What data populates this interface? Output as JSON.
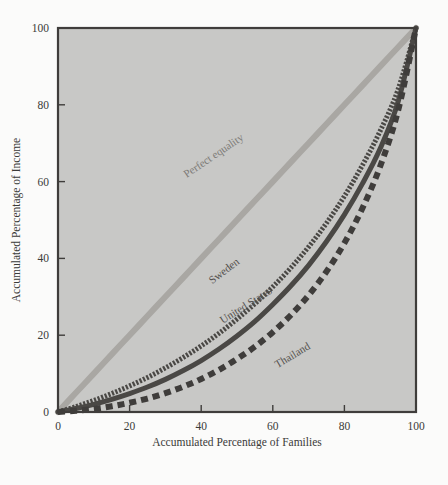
{
  "figure": {
    "background_color": "#fbfbfa",
    "plot_background_color": "#c8c8c6",
    "frame_color": "#3f3d3b"
  },
  "chart_data": {
    "type": "line",
    "title": "",
    "subtitle": "",
    "xlabel": "Accumulated Percentage of Families",
    "ylabel": "Accumulated Percentage of Income",
    "xlim": [
      0,
      100
    ],
    "ylim": [
      0,
      100
    ],
    "xticks": [
      0,
      20,
      40,
      60,
      80,
      100
    ],
    "yticks": [
      0,
      20,
      40,
      60,
      80,
      100
    ],
    "xtick_labels": [
      "0",
      "20",
      "40",
      "60",
      "80",
      "100"
    ],
    "ytick_labels": [
      "0",
      "20",
      "40",
      "60",
      "80",
      "100"
    ],
    "grid": false,
    "legend_position": "inline-annotations",
    "annotations": [
      {
        "text": "Perfect equality",
        "x": 44,
        "y": 66
      },
      {
        "text": "Sweden",
        "x": 47,
        "y": 36
      },
      {
        "text": "United States",
        "x": 53,
        "y": 27
      },
      {
        "text": "Thailand",
        "x": 66,
        "y": 14
      }
    ],
    "x": [
      0,
      5,
      10,
      15,
      20,
      25,
      30,
      35,
      40,
      45,
      50,
      55,
      60,
      65,
      70,
      75,
      80,
      85,
      90,
      95,
      100
    ],
    "series": [
      {
        "name": "Perfect equality",
        "color": "#a9a7a3",
        "style": "solid",
        "width": 6,
        "values": [
          0,
          5,
          10,
          15,
          20,
          25,
          30,
          35,
          40,
          45,
          50,
          55,
          60,
          65,
          70,
          75,
          80,
          85,
          90,
          95,
          100
        ]
      },
      {
        "name": "Sweden",
        "color": "#4a4845",
        "style": "fine-dotted",
        "width": 5,
        "values": [
          0,
          1.4,
          3.0,
          4.8,
          6.8,
          9.0,
          11.5,
          14.2,
          17.2,
          20.5,
          24.2,
          28.2,
          32.6,
          37.5,
          43.0,
          49.2,
          56.2,
          64.2,
          73.2,
          84.0,
          100
        ]
      },
      {
        "name": "United States",
        "color": "#4a4845",
        "style": "solid",
        "width": 5,
        "values": [
          0,
          0.9,
          2.0,
          3.3,
          4.8,
          6.5,
          8.5,
          10.8,
          13.4,
          16.4,
          19.8,
          23.6,
          28.0,
          32.8,
          38.2,
          44.4,
          51.4,
          59.4,
          68.6,
          80.8,
          100
        ]
      },
      {
        "name": "Thailand",
        "color": "#3f3d3b",
        "style": "dashed",
        "width": 6,
        "values": [
          0,
          0.3,
          0.8,
          1.5,
          2.4,
          3.5,
          4.9,
          6.6,
          8.6,
          11.0,
          13.8,
          17.0,
          20.8,
          25.2,
          30.4,
          36.6,
          44.0,
          53.0,
          64.0,
          78.5,
          100
        ]
      }
    ]
  }
}
